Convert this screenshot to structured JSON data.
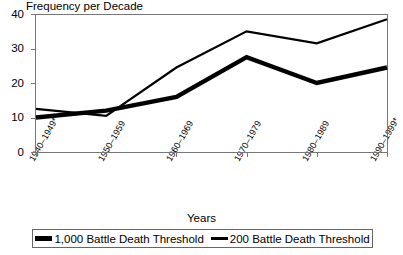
{
  "chart_data": {
    "type": "line",
    "title": "Frequency per Decade",
    "xlabel": "Years",
    "ylabel": "",
    "categories": [
      "1940–1949**",
      "1950–1959",
      "1960–1969",
      "1970–1979",
      "1980–1989",
      "1990–1999*"
    ],
    "ytick_labels": [
      "40",
      "30",
      "20",
      "10",
      "0"
    ],
    "ytick_values": [
      40,
      30,
      20,
      10,
      0
    ],
    "ylim": [
      0,
      40
    ],
    "grid": false,
    "legend_position": "bottom",
    "series": [
      {
        "name": "1,000 Battle Death Threshold",
        "style": "thick",
        "values": [
          10,
          12,
          16,
          27.5,
          20,
          24.5
        ]
      },
      {
        "name": "200 Battle Death Threshold",
        "style": "thin",
        "values": [
          12.5,
          10.5,
          24.5,
          35,
          31.5,
          38.5
        ]
      }
    ]
  },
  "axes": {
    "y_labels": [
      {
        "text": "40",
        "top": 9
      },
      {
        "text": "30",
        "top": 43
      },
      {
        "text": "20",
        "top": 78
      },
      {
        "text": "10",
        "top": 112
      },
      {
        "text": "0",
        "top": 147
      }
    ],
    "x_labels": [
      {
        "text": "1940–1949**",
        "left": 27,
        "top": 158
      },
      {
        "text": "1950–1959",
        "left": 96,
        "top": 158
      },
      {
        "text": "1960–1969",
        "left": 164,
        "top": 158
      },
      {
        "text": "1970–1979",
        "left": 232,
        "top": 158
      },
      {
        "text": "1980–1989",
        "left": 300,
        "top": 158
      },
      {
        "text": "1990–1999*",
        "left": 368,
        "top": 158
      }
    ]
  },
  "legend": {
    "items": [
      {
        "label": "1,000 Battle Death Threshold",
        "style": "thick"
      },
      {
        "label": "200 Battle Death Threshold",
        "style": "thin"
      }
    ]
  },
  "colors": {
    "line": "#000000",
    "frame": "#777777",
    "background": "#ffffff"
  }
}
